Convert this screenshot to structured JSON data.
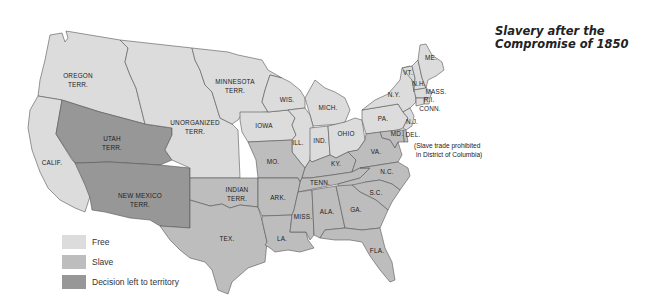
{
  "title": "Slavery after the Compromise of 1850",
  "colors": {
    "free": "#dcdcdc",
    "slave": "#bdbdbd",
    "decision": "#979797",
    "border": "#555555"
  },
  "legend": [
    {
      "status": "free",
      "label": "Free"
    },
    {
      "status": "slave",
      "label": "Slave"
    },
    {
      "status": "decision",
      "label": "Decision left to territory"
    }
  ],
  "regions": {
    "oregon": {
      "label1": "OREGON",
      "label2": "TERR.",
      "status": "free"
    },
    "calif": {
      "label1": "CALIF.",
      "status": "free"
    },
    "utah": {
      "label1": "UTAH",
      "label2": "TERR.",
      "status": "decision"
    },
    "new_mexico": {
      "label1": "NEW MEXICO",
      "label2": "TERR.",
      "status": "decision"
    },
    "unorganized": {
      "label1": "UNORGANIZED",
      "label2": "TERR.",
      "status": "free"
    },
    "minnesota": {
      "label1": "MINNESOTA",
      "label2": "TERR.",
      "status": "free"
    },
    "indian": {
      "label1": "INDIAN",
      "label2": "TERR.",
      "status": "slave"
    },
    "tex": {
      "label1": "TEX.",
      "status": "slave"
    },
    "iowa": {
      "label1": "IOWA",
      "status": "free"
    },
    "wis": {
      "label1": "WIS.",
      "status": "free"
    },
    "mich": {
      "label1": "MICH.",
      "status": "free"
    },
    "ill": {
      "label1": "ILL.",
      "status": "free"
    },
    "ind": {
      "label1": "IND.",
      "status": "free"
    },
    "ohio": {
      "label1": "OHIO",
      "status": "free"
    },
    "pa": {
      "label1": "PA.",
      "status": "free"
    },
    "ny": {
      "label1": "N.Y.",
      "status": "free"
    },
    "vt": {
      "label1": "VT.",
      "status": "free"
    },
    "nh": {
      "label1": "N.H.",
      "status": "free"
    },
    "me": {
      "label1": "ME.",
      "status": "free"
    },
    "mass": {
      "label1": "MASS.",
      "status": "free"
    },
    "ri": {
      "label1": "R.I.",
      "status": "free"
    },
    "conn": {
      "label1": "CONN.",
      "status": "free"
    },
    "nj": {
      "label1": "N.J.",
      "status": "free"
    },
    "del": {
      "label1": "DEL.",
      "status": "slave"
    },
    "md": {
      "label1": "MD.",
      "status": "slave"
    },
    "mo": {
      "label1": "MO.",
      "status": "slave"
    },
    "ky": {
      "label1": "KY.",
      "status": "slave"
    },
    "va": {
      "label1": "VA.",
      "status": "slave"
    },
    "tenn": {
      "label1": "TENN.",
      "status": "slave"
    },
    "nc": {
      "label1": "N.C.",
      "status": "slave"
    },
    "sc": {
      "label1": "S.C.",
      "status": "slave"
    },
    "ark": {
      "label1": "ARK.",
      "status": "slave"
    },
    "la": {
      "label1": "LA.",
      "status": "slave"
    },
    "miss": {
      "label1": "MISS.",
      "status": "slave"
    },
    "ala": {
      "label1": "ALA.",
      "status": "slave"
    },
    "ga": {
      "label1": "GA.",
      "status": "slave"
    },
    "fla": {
      "label1": "FLA.",
      "status": "slave"
    }
  },
  "annotation": {
    "line1": "(Slave trade prohibited",
    "line2": "in District of Columbia)"
  }
}
